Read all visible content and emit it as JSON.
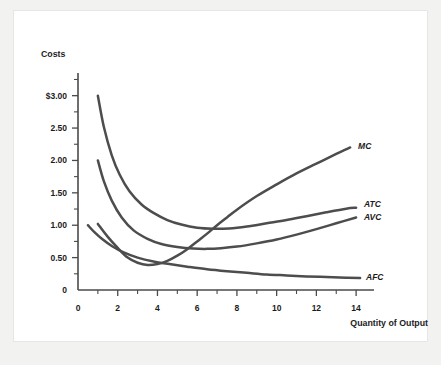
{
  "figure": {
    "background_color": "#f2f2f0",
    "plate_color": "#ffffff",
    "curve_color": "#4d4d4d",
    "axis_color": "#4a4a4a",
    "text_color": "#1c1c1c"
  },
  "chart_data": {
    "type": "line",
    "title": "",
    "ylabel": "Costs",
    "xlabel": "Quantity of Output",
    "xlim": [
      0,
      14.8
    ],
    "ylim": [
      0,
      3.35
    ],
    "grid": false,
    "legend_position": "right-of-curve-ends",
    "y_ticks": [
      {
        "value": 0,
        "label": "0"
      },
      {
        "value": 0.5,
        "label": "0.50"
      },
      {
        "value": 1.0,
        "label": "1.00"
      },
      {
        "value": 1.5,
        "label": "1.50"
      },
      {
        "value": 2.0,
        "label": "2.00"
      },
      {
        "value": 2.5,
        "label": "2.50"
      },
      {
        "value": 3.0,
        "label": "$3.00"
      }
    ],
    "y_minor_ticks": [
      0.25,
      0.75,
      1.25,
      1.75,
      2.25,
      2.75,
      3.25
    ],
    "x_ticks": [
      {
        "value": 0,
        "label": "0"
      },
      {
        "value": 2,
        "label": "2"
      },
      {
        "value": 4,
        "label": "4"
      },
      {
        "value": 6,
        "label": "6"
      },
      {
        "value": 8,
        "label": "8"
      },
      {
        "value": 10,
        "label": "10"
      },
      {
        "value": 12,
        "label": "12"
      },
      {
        "value": 14,
        "label": "14"
      }
    ],
    "x_minor_ticks": [
      1,
      3,
      5,
      7,
      9,
      11,
      13
    ],
    "series": [
      {
        "name": "ATC",
        "label": "ATC",
        "description": "Average Total Cost",
        "x": [
          1,
          1.3,
          1.7,
          2.1,
          2.6,
          3.2,
          3.8,
          4.5,
          5.2,
          6,
          6.8,
          7.6,
          8.5,
          9.5,
          10.5,
          11.5,
          12.5,
          13.5,
          14
        ],
        "values": [
          3.0,
          2.52,
          2.08,
          1.78,
          1.52,
          1.32,
          1.19,
          1.08,
          1.01,
          0.96,
          0.945,
          0.95,
          0.98,
          1.03,
          1.08,
          1.14,
          1.2,
          1.255,
          1.27
        ]
      },
      {
        "name": "AVC",
        "label": "AVC",
        "description": "Average Variable Cost",
        "x": [
          1,
          1.3,
          1.7,
          2.2,
          2.8,
          3.5,
          4.2,
          5,
          5.8,
          6.5,
          7.2,
          8,
          9,
          10,
          11,
          12,
          13,
          14
        ],
        "values": [
          2.0,
          1.68,
          1.38,
          1.12,
          0.92,
          0.79,
          0.71,
          0.665,
          0.64,
          0.635,
          0.645,
          0.67,
          0.72,
          0.78,
          0.855,
          0.94,
          1.03,
          1.12
        ]
      },
      {
        "name": "MC",
        "label": "MC",
        "description": "Marginal Cost",
        "x": [
          1,
          1.5,
          2,
          2.5,
          3,
          3.5,
          4,
          4.5,
          5,
          5.5,
          6,
          6.5,
          7,
          7.5,
          8,
          9,
          10,
          11,
          12,
          13,
          13.7
        ],
        "values": [
          1.02,
          0.82,
          0.65,
          0.5,
          0.42,
          0.385,
          0.4,
          0.45,
          0.53,
          0.63,
          0.75,
          0.87,
          1.0,
          1.12,
          1.24,
          1.45,
          1.63,
          1.8,
          1.95,
          2.1,
          2.2
        ]
      },
      {
        "name": "AFC",
        "label": "AFC",
        "description": "Average Fixed Cost",
        "x": [
          0.5,
          0.8,
          1.2,
          1.7,
          2.3,
          3,
          3.8,
          4.6,
          5.5,
          6.5,
          7.5,
          8.5,
          9.5,
          10.5,
          11.5,
          12.5,
          13.5,
          14.2
        ],
        "values": [
          1.0,
          0.9,
          0.79,
          0.68,
          0.58,
          0.5,
          0.44,
          0.4,
          0.36,
          0.32,
          0.29,
          0.265,
          0.24,
          0.225,
          0.21,
          0.2,
          0.19,
          0.185
        ]
      }
    ],
    "curve_labels": [
      {
        "name": "MC",
        "text": "MC",
        "x": 14.1,
        "y": 2.22
      },
      {
        "name": "ATC",
        "text": "ATC",
        "x": 14.4,
        "y": 1.32
      },
      {
        "name": "AVC",
        "text": "AVC",
        "x": 14.4,
        "y": 1.12
      },
      {
        "name": "AFC",
        "text": "AFC",
        "x": 14.5,
        "y": 0.2
      }
    ]
  }
}
